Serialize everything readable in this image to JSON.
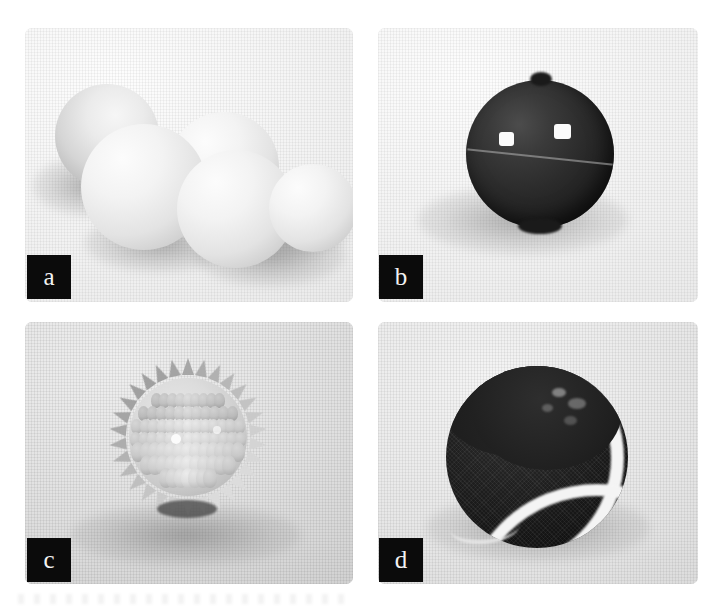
{
  "figure": {
    "background_color": "#ffffff",
    "layout": "2x2-grid",
    "panel_count": 4,
    "badge_color": "#0b0b0b",
    "badge_text_color": "#f2f2f2"
  },
  "panels": [
    {
      "label": "a",
      "position": "top-left",
      "subject": "cluster of five pale smooth spheres on light cloth",
      "object_count": 5,
      "dominant_color": "#e9e9e9"
    },
    {
      "label": "b",
      "position": "top-right",
      "subject": "single dark glossy sphere with two specular highlights and a seam",
      "object_count": 1,
      "dominant_color": "#262626"
    },
    {
      "label": "c",
      "position": "bottom-left",
      "subject": "light grey spiky massage ball covered in conical nubs",
      "object_count": 1,
      "dominant_color": "#cfcfcf"
    },
    {
      "label": "d",
      "position": "bottom-right",
      "subject": "dark felt ball with a white curved seam band",
      "object_count": 1,
      "dominant_color": "#1b1b1b"
    }
  ],
  "chart_data": {
    "type": "table",
    "title": "",
    "categories": [
      "a",
      "b",
      "c",
      "d"
    ],
    "values": [
      5,
      1,
      1,
      1
    ]
  }
}
